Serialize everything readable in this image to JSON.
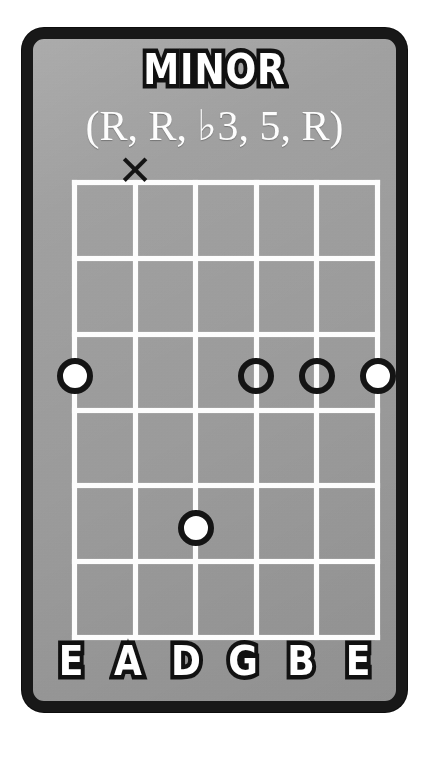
{
  "card": {
    "title": "MINOR",
    "formula": "(R, R, ♭3, 5, R)",
    "background_color": "#9b9b9b",
    "border_color": "#181818",
    "line_color": "#fdfdfd",
    "marker_ring_color": "#141414",
    "marker_fill_color": "#ffffff"
  },
  "fretboard": {
    "string_count": 6,
    "fret_count": 6,
    "string_labels": [
      "E",
      "A",
      "D",
      "G",
      "B",
      "E"
    ],
    "strings": [
      {
        "index": 1,
        "label": "E",
        "marker": "dot-filled",
        "fret": 3,
        "x_pct": 0
      },
      {
        "index": 2,
        "label": "A",
        "marker": "x-mute",
        "fret": 0,
        "x_pct": 20
      },
      {
        "index": 3,
        "label": "D",
        "marker": "dot-filled",
        "fret": 5,
        "x_pct": 40
      },
      {
        "index": 4,
        "label": "G",
        "marker": "dot-open",
        "fret": 3,
        "x_pct": 60
      },
      {
        "index": 5,
        "label": "B",
        "marker": "dot-open",
        "fret": 3,
        "x_pct": 80
      },
      {
        "index": 6,
        "label": "E",
        "marker": "dot-filled",
        "fret": 3,
        "x_pct": 100
      }
    ],
    "markers": [
      {
        "name": "marker-string-1-fret-3",
        "type": "filled",
        "x_pct": 0,
        "y_pct": 50,
        "symbol": ""
      },
      {
        "name": "marker-string-4-fret-3",
        "type": "open",
        "x_pct": 60,
        "y_pct": 50,
        "symbol": ""
      },
      {
        "name": "marker-string-5-fret-3",
        "type": "open",
        "x_pct": 80,
        "y_pct": 50,
        "symbol": ""
      },
      {
        "name": "marker-string-6-fret-3",
        "type": "filled",
        "x_pct": 100,
        "y_pct": 50,
        "symbol": ""
      },
      {
        "name": "marker-string-3-fret-5",
        "type": "filled",
        "x_pct": 40,
        "y_pct": 83.4,
        "symbol": ""
      }
    ],
    "mute_marker": {
      "name": "mute-x-string-2",
      "symbol": "✕",
      "x_pct": 20,
      "y_pct": -3
    }
  }
}
